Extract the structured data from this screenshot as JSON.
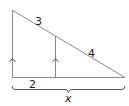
{
  "diagram": {
    "type": "geometry-similar-triangles",
    "labels": {
      "hypotenuse_upper_segment": "3",
      "hypotenuse_lower_segment": "4",
      "base_left_segment": "2",
      "base_total": "x"
    },
    "marks": {
      "parallel_indicator": "single arrow on each vertical segment"
    },
    "colors": {
      "lines": "#8a8a8a",
      "text": "#222222",
      "background": "#ffffff"
    }
  }
}
